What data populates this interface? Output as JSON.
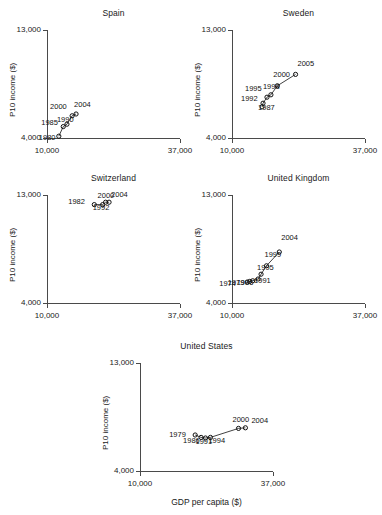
{
  "figure": {
    "xlabel": "GDP per capita ($)",
    "ylabel": "P10 income ($)",
    "xticks": [
      "10,000",
      "37,000"
    ],
    "yticks": [
      "13,000",
      "4,000"
    ],
    "axis_color": "#4a4a4a",
    "marker_color": "#111111",
    "line_color": "#111111"
  },
  "chart_data": {
    "type": "scatter",
    "title": "",
    "xlabel": "GDP per capita ($)",
    "ylabel": "P10 income ($)",
    "xlim": [
      10000,
      37000
    ],
    "ylim": [
      4000,
      13000
    ],
    "xticks": [
      10000,
      37000
    ],
    "yticks": [
      4000,
      13000
    ],
    "xtick_labels": [
      "10,000",
      "37,000"
    ],
    "ytick_labels": [
      "4,000",
      "13,000"
    ],
    "grid": false,
    "legend": "none",
    "panels": [
      {
        "title": "Spain",
        "points": [
          {
            "label": "1980",
            "x": 12400,
            "y": 4150
          },
          {
            "label": "1985",
            "x": 13300,
            "y": 4950
          },
          {
            "label": "1990",
            "x": 14050,
            "y": 5150
          },
          {
            "label": "2000",
            "x": 15100,
            "y": 5850
          },
          {
            "label": "2004",
            "x": 15900,
            "y": 6000
          }
        ]
      },
      {
        "title": "Sweden",
        "points": [
          {
            "label": "1987",
            "x": 16100,
            "y": 6600
          },
          {
            "label": "1992",
            "x": 16300,
            "y": 6900
          },
          {
            "label": "1995",
            "x": 17100,
            "y": 7400
          },
          {
            "label": "1998",
            "x": 17900,
            "y": 7600
          },
          {
            "label": "2000",
            "x": 19200,
            "y": 8350
          },
          {
            "label": "2005",
            "x": 22900,
            "y": 9300
          }
        ]
      },
      {
        "title": "Switzerland",
        "points": [
          {
            "label": "1982",
            "x": 19600,
            "y": 12200
          },
          {
            "label": "1992",
            "x": 21300,
            "y": 12200
          },
          {
            "label": "2000",
            "x": 21900,
            "y": 12400
          },
          {
            "label": "2004",
            "x": 22600,
            "y": 12400
          }
        ]
      },
      {
        "title": "United Kingdom",
        "points": [
          {
            "label": "1974",
            "x": 13100,
            "y": 5750
          },
          {
            "label": "1979",
            "x": 13600,
            "y": 5800
          },
          {
            "label": "1986",
            "x": 14200,
            "y": 5850
          },
          {
            "label": "1991",
            "x": 15300,
            "y": 6000
          },
          {
            "label": "1995",
            "x": 15900,
            "y": 6400
          },
          {
            "label": "1999",
            "x": 17000,
            "y": 7100
          },
          {
            "label": "2004",
            "x": 19600,
            "y": 8250
          }
        ]
      },
      {
        "title": "United States",
        "points": [
          {
            "label": "1979",
            "x": 21200,
            "y": 7000
          },
          {
            "label": "1986",
            "x": 22400,
            "y": 6800
          },
          {
            "label": "1991",
            "x": 23300,
            "y": 6750
          },
          {
            "label": "1994",
            "x": 24300,
            "y": 6800
          },
          {
            "label": "2000",
            "x": 30000,
            "y": 7550
          },
          {
            "label": "2004",
            "x": 31400,
            "y": 7600
          }
        ]
      }
    ]
  }
}
